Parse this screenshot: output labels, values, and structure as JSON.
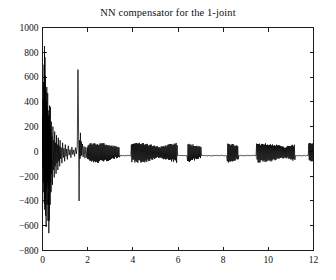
{
  "figure": {
    "background_color": "#ffffff",
    "axes_color": "#1c1c1c",
    "line_color": "#000000"
  },
  "chart_data": {
    "type": "line",
    "title": "NN compensator for the 1-joint",
    "subtitle": "",
    "xlabel": "",
    "ylabel": "",
    "xlim": [
      0,
      12
    ],
    "ylim": [
      -800,
      1000
    ],
    "xticks": [
      0,
      2,
      4,
      6,
      8,
      10,
      12
    ],
    "xtick_labels": [
      "0",
      "2",
      "4",
      "6",
      "8",
      "10",
      "12"
    ],
    "yticks": [
      -800,
      -600,
      -400,
      -200,
      0,
      200,
      400,
      600,
      800,
      1000
    ],
    "ytick_labels": [
      "-800",
      "-600",
      "-400",
      "-200",
      "0",
      "200",
      "400",
      "600",
      "800",
      "1000"
    ],
    "grid": false,
    "legend": null,
    "legend_position": "none",
    "annotations": [],
    "series": [
      {
        "name": "NN compensator torque (1-joint)",
        "color": "#000000",
        "linewidth": 0.75,
        "description": "Large decaying oscillatory transient from t=0 to about t=2 with peaks near 850 and -660 and an isolated spike near t=1.65 reaching 660 then -400, followed by a small bounded chattering band roughly between -90 and 70 for the rest of the run.",
        "x": [
          0,
          0.01,
          0.02,
          0.03,
          0.04,
          0.05,
          0.06,
          0.07,
          0.08,
          0.09,
          0.1,
          0.11,
          0.12,
          0.13,
          0.14,
          0.15,
          0.16,
          0.17,
          0.18,
          0.19,
          0.2,
          0.21,
          0.22,
          0.23,
          0.24,
          0.25,
          0.26,
          0.27,
          0.28,
          0.29,
          0.3,
          0.31,
          0.32,
          0.33,
          0.34,
          0.35,
          0.36,
          0.37,
          0.38,
          0.39,
          0.4,
          0.42,
          0.44,
          0.46,
          0.48,
          0.5,
          0.52,
          0.54,
          0.56,
          0.58,
          0.6,
          0.62,
          0.64,
          0.66,
          0.68,
          0.7,
          0.72,
          0.74,
          0.76,
          0.78,
          0.8,
          0.83,
          0.86,
          0.89,
          0.92,
          0.95,
          0.98,
          1.01,
          1.04,
          1.07,
          1.1,
          1.14,
          1.18,
          1.22,
          1.26,
          1.3,
          1.34,
          1.38,
          1.42,
          1.46,
          1.5,
          1.54,
          1.57,
          1.6,
          1.62,
          1.64,
          1.66,
          1.68,
          1.7,
          1.72,
          1.74,
          1.77,
          1.8,
          1.84,
          1.88,
          1.92,
          1.96,
          2.0
        ],
        "y": [
          0,
          290,
          -140,
          420,
          -250,
          560,
          -330,
          700,
          -420,
          850,
          -470,
          760,
          -380,
          610,
          -520,
          480,
          -610,
          400,
          -300,
          520,
          -430,
          360,
          -250,
          470,
          -560,
          330,
          -430,
          290,
          -660,
          250,
          -560,
          370,
          -300,
          200,
          -430,
          360,
          -250,
          150,
          -330,
          240,
          -180,
          120,
          -270,
          200,
          -150,
          90,
          -210,
          160,
          -120,
          70,
          -180,
          130,
          -95,
          55,
          -150,
          110,
          -80,
          45,
          -120,
          90,
          -60,
          30,
          -95,
          70,
          -50,
          25,
          -80,
          55,
          -40,
          20,
          -65,
          45,
          -30,
          15,
          -50,
          35,
          -25,
          12,
          -40,
          30,
          -20,
          45,
          660,
          120,
          -400,
          90,
          -60,
          150,
          -40,
          80,
          -30,
          60,
          -45,
          40,
          -55,
          35,
          -50,
          30
        ]
      }
    ],
    "steady_state_band": {
      "t_start": 2.0,
      "t_end": 12.0,
      "y_min": -95,
      "y_max": 70,
      "description": "Bounded high-frequency chattering with quiet plateaus near t=3.4-3.9, t=6.0-6.4, t=7.0-8.2, t=8.7-9.5 and t=11.2-11.8"
    }
  }
}
